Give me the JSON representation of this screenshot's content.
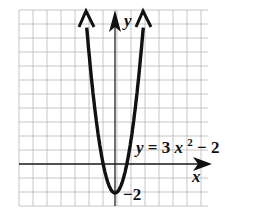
{
  "chart_data": {
    "type": "line",
    "title": "",
    "function": "y = 3x^2 - 2",
    "equation_label": {
      "lhs": "y",
      "rhs_prefix": " = 3",
      "var": "x",
      "exp": "2",
      "rhs_suffix": " − 2"
    },
    "xlabel": "x",
    "ylabel": "y",
    "annotations": [
      {
        "text": "−2",
        "x": 0,
        "y": -2,
        "note": "vertex / y-intercept"
      }
    ],
    "series": [
      {
        "name": "y = 3x^2 - 2",
        "x": [
          -1,
          -0.5,
          0,
          0.5,
          1
        ],
        "y": [
          1,
          -1.25,
          -2,
          -1.25,
          1
        ]
      }
    ],
    "xlim": [
      -7,
      7
    ],
    "ylim": [
      -3,
      11
    ],
    "grid": true,
    "legend": "none"
  },
  "labels": {
    "y_axis": "y",
    "x_axis": "x",
    "vertex": "−2",
    "eq_y": "y",
    "eq_eq": " = 3",
    "eq_x": "x",
    "eq_exp": "2",
    "eq_tail": " − 2"
  }
}
